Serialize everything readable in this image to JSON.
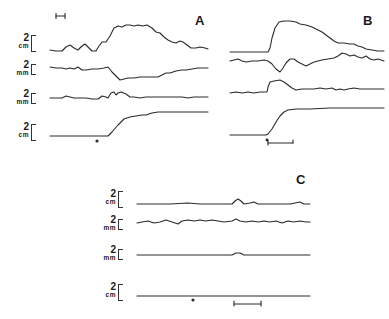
{
  "figure": {
    "panels": [
      {
        "id": "A",
        "label": "A",
        "traces": [
          {
            "scale_value": "2",
            "scale_unit": "cm"
          },
          {
            "scale_value": "2",
            "scale_unit": "mm"
          },
          {
            "scale_value": "2",
            "scale_unit": "mm"
          },
          {
            "scale_value": "2",
            "scale_unit": "cm"
          }
        ],
        "markers": [
          "dot"
        ],
        "time_scale_bar": true
      },
      {
        "id": "B",
        "label": "B",
        "traces": [
          {
            "scale_value": "",
            "scale_unit": ""
          },
          {
            "scale_value": "",
            "scale_unit": ""
          },
          {
            "scale_value": "",
            "scale_unit": ""
          },
          {
            "scale_value": "",
            "scale_unit": ""
          }
        ],
        "markers": [
          "dot",
          "interval-bracket"
        ]
      },
      {
        "id": "C",
        "label": "C",
        "traces": [
          {
            "scale_value": "2",
            "scale_unit": "cm"
          },
          {
            "scale_value": "2",
            "scale_unit": "mm"
          },
          {
            "scale_value": "2",
            "scale_unit": "mm"
          },
          {
            "scale_value": "2",
            "scale_unit": "cm"
          }
        ],
        "markers": [
          "dot",
          "interval-bracket"
        ]
      }
    ],
    "ink_color": "#2a2a2a"
  }
}
